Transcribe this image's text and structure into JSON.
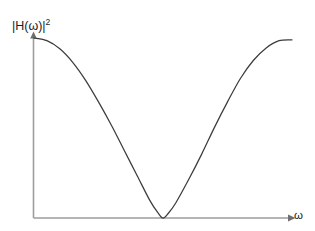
{
  "figure": {
    "name": "magnitude-squared-frequency-response",
    "background_color": "#ffffff",
    "axis_color": "#9d9d9d",
    "curve_color": "#3c3c3c"
  },
  "labels": {
    "y_axis_base": "|H(ω)|",
    "y_axis_exponent": "2",
    "x_axis": "ω"
  },
  "chart_data": {
    "type": "line",
    "title": "",
    "subtitle": "",
    "xlabel": "ω",
    "ylabel": "|H(ω)|²",
    "grid": false,
    "legend": null,
    "annotations": [],
    "xlim": [
      0,
      1
    ],
    "ylim": [
      0,
      1
    ],
    "axis_ticks": {
      "x": [],
      "y": []
    },
    "series": [
      {
        "name": "|H(ω)|²",
        "color": "#3c3c3c",
        "x": [
          0.0,
          0.05,
          0.1,
          0.15,
          0.2,
          0.25,
          0.3,
          0.35,
          0.4,
          0.45,
          0.48,
          0.5,
          0.52,
          0.55,
          0.6,
          0.65,
          0.7,
          0.75,
          0.8,
          0.85,
          0.9,
          0.95,
          1.0
        ],
        "y": [
          1.0,
          0.985,
          0.94,
          0.865,
          0.765,
          0.645,
          0.515,
          0.375,
          0.235,
          0.095,
          0.03,
          0.0,
          0.025,
          0.085,
          0.215,
          0.355,
          0.505,
          0.645,
          0.775,
          0.875,
          0.945,
          0.985,
          0.99
        ]
      }
    ]
  }
}
